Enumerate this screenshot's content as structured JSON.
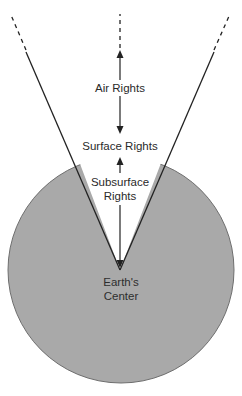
{
  "diagram": {
    "colors": {
      "earth_fill": "#a9a9a9",
      "earth_stroke": "#6e6e6e",
      "line": "#222222",
      "text": "#2a2a2a",
      "background": "#ffffff"
    },
    "labels": {
      "air_rights": "Air Rights",
      "surface_rights": "Surface Rights",
      "subsurface_line1": "Subsurface",
      "subsurface_line2": "Rights",
      "center_line1": "Earth's",
      "center_line2": "Center"
    },
    "arrows": [
      {
        "name": "air-rights-up-arrow",
        "direction": "up"
      },
      {
        "name": "air-rights-down-arrow",
        "direction": "down"
      },
      {
        "name": "subsurface-up-arrow",
        "direction": "up"
      },
      {
        "name": "subsurface-down-arrow",
        "direction": "down"
      }
    ],
    "annotations": [
      "Dashed lines indicate rights extend indefinitely upward"
    ]
  }
}
